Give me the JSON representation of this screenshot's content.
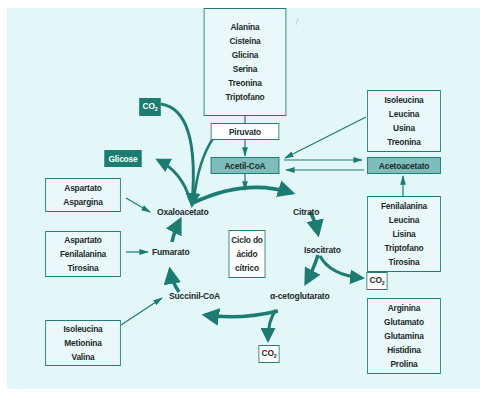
{
  "diagram": {
    "title": "Ciclo do ácido cítrico",
    "colors": {
      "background": "#e3f6f8",
      "teal_dark": "#1c7c72",
      "teal_medium": "#7fbdbd",
      "text": "#1d2a2a"
    },
    "center_label": [
      "Ciclo do",
      "ácido",
      "cítrico"
    ],
    "cycle_intermediates": {
      "oxaloacetato": "Oxaloacetato",
      "citrato": "Citrato",
      "isocitrato": "Isocitrato",
      "alfa_cetoglutarato": "α-cetoglutarato",
      "succinil_coa": "Succinil-CoA",
      "fumarato": "Fumarato"
    },
    "hub_nodes": {
      "piruvato": "Piruvato",
      "acetil_coa": "Acetil-CoA",
      "acetoacetato": "Acetoacetato",
      "glicose": "Glicose"
    },
    "co2_label": "CO",
    "co2_sub": "2",
    "amino_acid_groups": {
      "to_piruvato": [
        "Alanina",
        "Cisteína",
        "Glicina",
        "Serina",
        "Treonina",
        "Triptofano"
      ],
      "to_acetil_coa": [
        "Isoleucina",
        "Leucina",
        "Usina",
        "Treonina"
      ],
      "to_acetoacetato": [
        "Fenilalanina",
        "Leucina",
        "Lisina",
        "Triptofano",
        "Tirosina"
      ],
      "to_alfa_cetoglutarato": [
        "Arginina",
        "Glutamato",
        "Glutamina",
        "Histidina",
        "Prolina"
      ],
      "to_oxaloacetato": [
        "Aspartato",
        "Aspargina"
      ],
      "to_fumarato": [
        "Aspartato",
        "Fenilalanina",
        "Tirosina"
      ],
      "to_succinil_coa": [
        "Isoleucina",
        "Metionina",
        "Valina"
      ]
    }
  }
}
